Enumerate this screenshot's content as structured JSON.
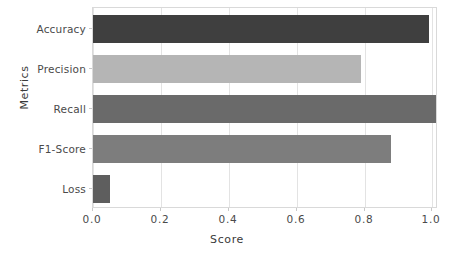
{
  "chart_data": {
    "type": "bar",
    "orientation": "horizontal",
    "title": "",
    "xlabel": "Score",
    "ylabel": "Metrics",
    "categories": [
      "Accuracy",
      "Precision",
      "Recall",
      "F1-Score",
      "Loss"
    ],
    "values": [
      0.98,
      0.78,
      1.0,
      0.87,
      0.05
    ],
    "bar_colors": [
      "#3f3f3f",
      "#b5b5b5",
      "#6a6a6a",
      "#7d7d7d",
      "#5e5e5e"
    ],
    "xlim": [
      0.0,
      1.0
    ],
    "xticks": [
      0.0,
      0.2,
      0.4,
      0.6,
      0.8,
      1.0
    ],
    "xtick_labels": [
      "0.0",
      "0.2",
      "0.4",
      "0.6",
      "0.8",
      "1.0"
    ],
    "grid": true,
    "grid_axis": "x",
    "legend": null,
    "series": [
      {
        "name": "Score",
        "points": [
          {
            "category": "Accuracy",
            "value": 0.98,
            "color": "#3f3f3f"
          },
          {
            "category": "Precision",
            "value": 0.78,
            "color": "#b5b5b5"
          },
          {
            "category": "Recall",
            "value": 1.0,
            "color": "#6a6a6a"
          },
          {
            "category": "F1-Score",
            "value": 0.87,
            "color": "#7d7d7d"
          },
          {
            "category": "Loss",
            "value": 0.05,
            "color": "#5e5e5e"
          }
        ]
      }
    ]
  },
  "axes": {
    "x_title": "Score",
    "y_title": "Metrics",
    "x_tick_labels": [
      "0.0",
      "0.2",
      "0.4",
      "0.6",
      "0.8",
      "1.0"
    ],
    "y_tick_labels": [
      "Accuracy",
      "Precision",
      "Recall",
      "F1-Score",
      "Loss"
    ]
  }
}
